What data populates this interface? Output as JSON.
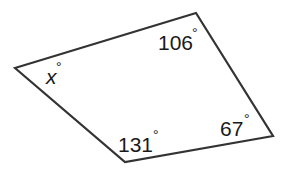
{
  "figure": {
    "shape": "quadrilateral",
    "stroke_color": "#333333",
    "vertices": [
      {
        "name": "left",
        "x": 15,
        "y": 68
      },
      {
        "name": "top",
        "x": 196,
        "y": 13
      },
      {
        "name": "right",
        "x": 273,
        "y": 136
      },
      {
        "name": "bottom",
        "x": 125,
        "y": 162
      }
    ],
    "angles": {
      "left": {
        "value": "x",
        "degree": "°"
      },
      "top": {
        "value": "106",
        "degree": "°"
      },
      "right": {
        "value": "67",
        "degree": "°"
      },
      "bottom": {
        "value": "131",
        "degree": "°"
      }
    }
  }
}
